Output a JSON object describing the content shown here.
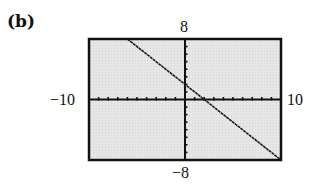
{
  "panel": {
    "label": "(b)"
  },
  "window": {
    "xmin_label": "−10",
    "xmax_label": "10",
    "ymax_label": "8",
    "ymin_label": "−8"
  },
  "colors": {
    "plot_background": "#e4e4e4",
    "frame": "#111111",
    "line": "#1a1a1a"
  },
  "chart_data": {
    "type": "line",
    "title": "(b)",
    "xlabel": "",
    "ylabel": "",
    "xlim": [
      -10,
      10
    ],
    "ylim": [
      -8,
      8
    ],
    "grid": false,
    "axes_with_ticks": true,
    "xtick_spacing": 1,
    "ytick_spacing": 1,
    "tick_labels": {
      "xmin": "-10",
      "xmax": "10",
      "ymin": "-8",
      "ymax": "8"
    },
    "series": [
      {
        "name": "y = -x + 2",
        "equation": "y = -x + 2",
        "x": [
          -6,
          10
        ],
        "y": [
          8,
          -8
        ]
      }
    ]
  }
}
